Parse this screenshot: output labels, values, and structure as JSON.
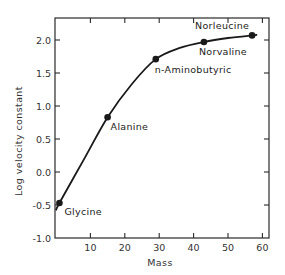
{
  "chart_data": {
    "type": "line",
    "title": "",
    "xlabel": "Mass",
    "ylabel": "Log velocity constant",
    "xlim": [
      0,
      62
    ],
    "ylim": [
      -1.0,
      2.25
    ],
    "x_ticks": [
      10,
      20,
      30,
      40,
      50,
      60
    ],
    "x_tick_labels": [
      "10",
      "20",
      "30",
      "40",
      "50",
      "60"
    ],
    "y_ticks": [
      -1.0,
      -0.5,
      0.0,
      0.5,
      1.0,
      1.5,
      2.0
    ],
    "y_tick_labels": [
      "-1.0",
      "-0.5",
      "0.0",
      "0.5",
      "1.0",
      "1.5",
      "2.0"
    ],
    "grid": false,
    "legend": null,
    "series": [
      {
        "name": "Amino acids",
        "x": [
          1,
          15,
          29,
          43,
          57
        ],
        "y": [
          -0.47,
          0.83,
          1.71,
          1.97,
          2.07
        ],
        "labels": [
          "Glycine",
          "Alanine",
          "n-Aminobutyric",
          "Norvaline",
          "Norleucine"
        ]
      }
    ],
    "curve": {
      "x": [
        0,
        1,
        8,
        15,
        22,
        29,
        36,
        43,
        50,
        57,
        58.5
      ],
      "y": [
        -0.58,
        -0.47,
        0.18,
        0.83,
        1.33,
        1.71,
        1.88,
        1.97,
        2.03,
        2.07,
        2.08
      ]
    },
    "annotations": [
      {
        "text": "Glycine",
        "x": 1,
        "y": -0.47,
        "dx": 5,
        "dy": 12
      },
      {
        "text": "Alanine",
        "x": 15,
        "y": 0.83,
        "dx": 3,
        "dy": 13
      },
      {
        "text": "n-Aminobutyric",
        "x": 29,
        "y": 1.71,
        "dx": -1,
        "dy": 14
      },
      {
        "text": "Norvaline",
        "x": 43,
        "y": 1.97,
        "dx": -5,
        "dy": 13
      },
      {
        "text": "Norleucine",
        "x": 57,
        "y": 2.07,
        "dx": -57,
        "dy": -6
      }
    ]
  }
}
